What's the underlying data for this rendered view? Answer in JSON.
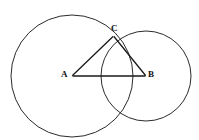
{
  "figure": {
    "background_color": "#ffffff",
    "stroke_color": "#2b2b2b",
    "segment_color": "#1a1a1a",
    "labels": {
      "vertex_a": "A",
      "vertex_b": "B",
      "vertex_c": "C"
    },
    "points": {
      "A": {
        "x": 72,
        "y": 76
      },
      "B": {
        "x": 146,
        "y": 76
      },
      "C": {
        "x": 113.5,
        "y": 36
      }
    },
    "circles": [
      {
        "name": "circle-left",
        "cx": 72,
        "cy": 76,
        "r": 61
      },
      {
        "name": "circle-right",
        "cx": 146,
        "cy": 76,
        "r": 45
      }
    ],
    "segments": [
      {
        "name": "segment-AB",
        "from": "A",
        "to": "B"
      },
      {
        "name": "segment-AC",
        "from": "A",
        "to": "C"
      },
      {
        "name": "segment-BC",
        "from": "B",
        "to": "C"
      }
    ]
  }
}
